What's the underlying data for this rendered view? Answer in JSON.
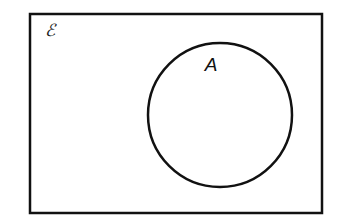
{
  "figure": {
    "background_color": "#ffffff",
    "stroke_color": "#111111"
  },
  "universal_set": {
    "label": "ℰ",
    "label_name": "universal-set-symbol",
    "description": "Universal set rectangle",
    "x": 30,
    "y": 14,
    "width": 292,
    "height": 199,
    "stroke_width": 2.5,
    "label_x": 45,
    "label_y": 36
  },
  "sets": [
    {
      "label": "A",
      "name": "set-a",
      "shape": "circle",
      "cx": 220,
      "cy": 115,
      "r": 72,
      "stroke_width": 2.5,
      "label_x": 211,
      "label_y": 66
    }
  ],
  "chart_data": {
    "type": "diagram",
    "diagram_type": "venn",
    "universe_label": "ℰ",
    "set_labels": [
      "A"
    ],
    "set_count": 1,
    "shading": "none",
    "regions": [
      {
        "name": "A",
        "shaded": false
      },
      {
        "name": "A'",
        "shaded": false
      }
    ],
    "legend": "none",
    "grid": false
  }
}
